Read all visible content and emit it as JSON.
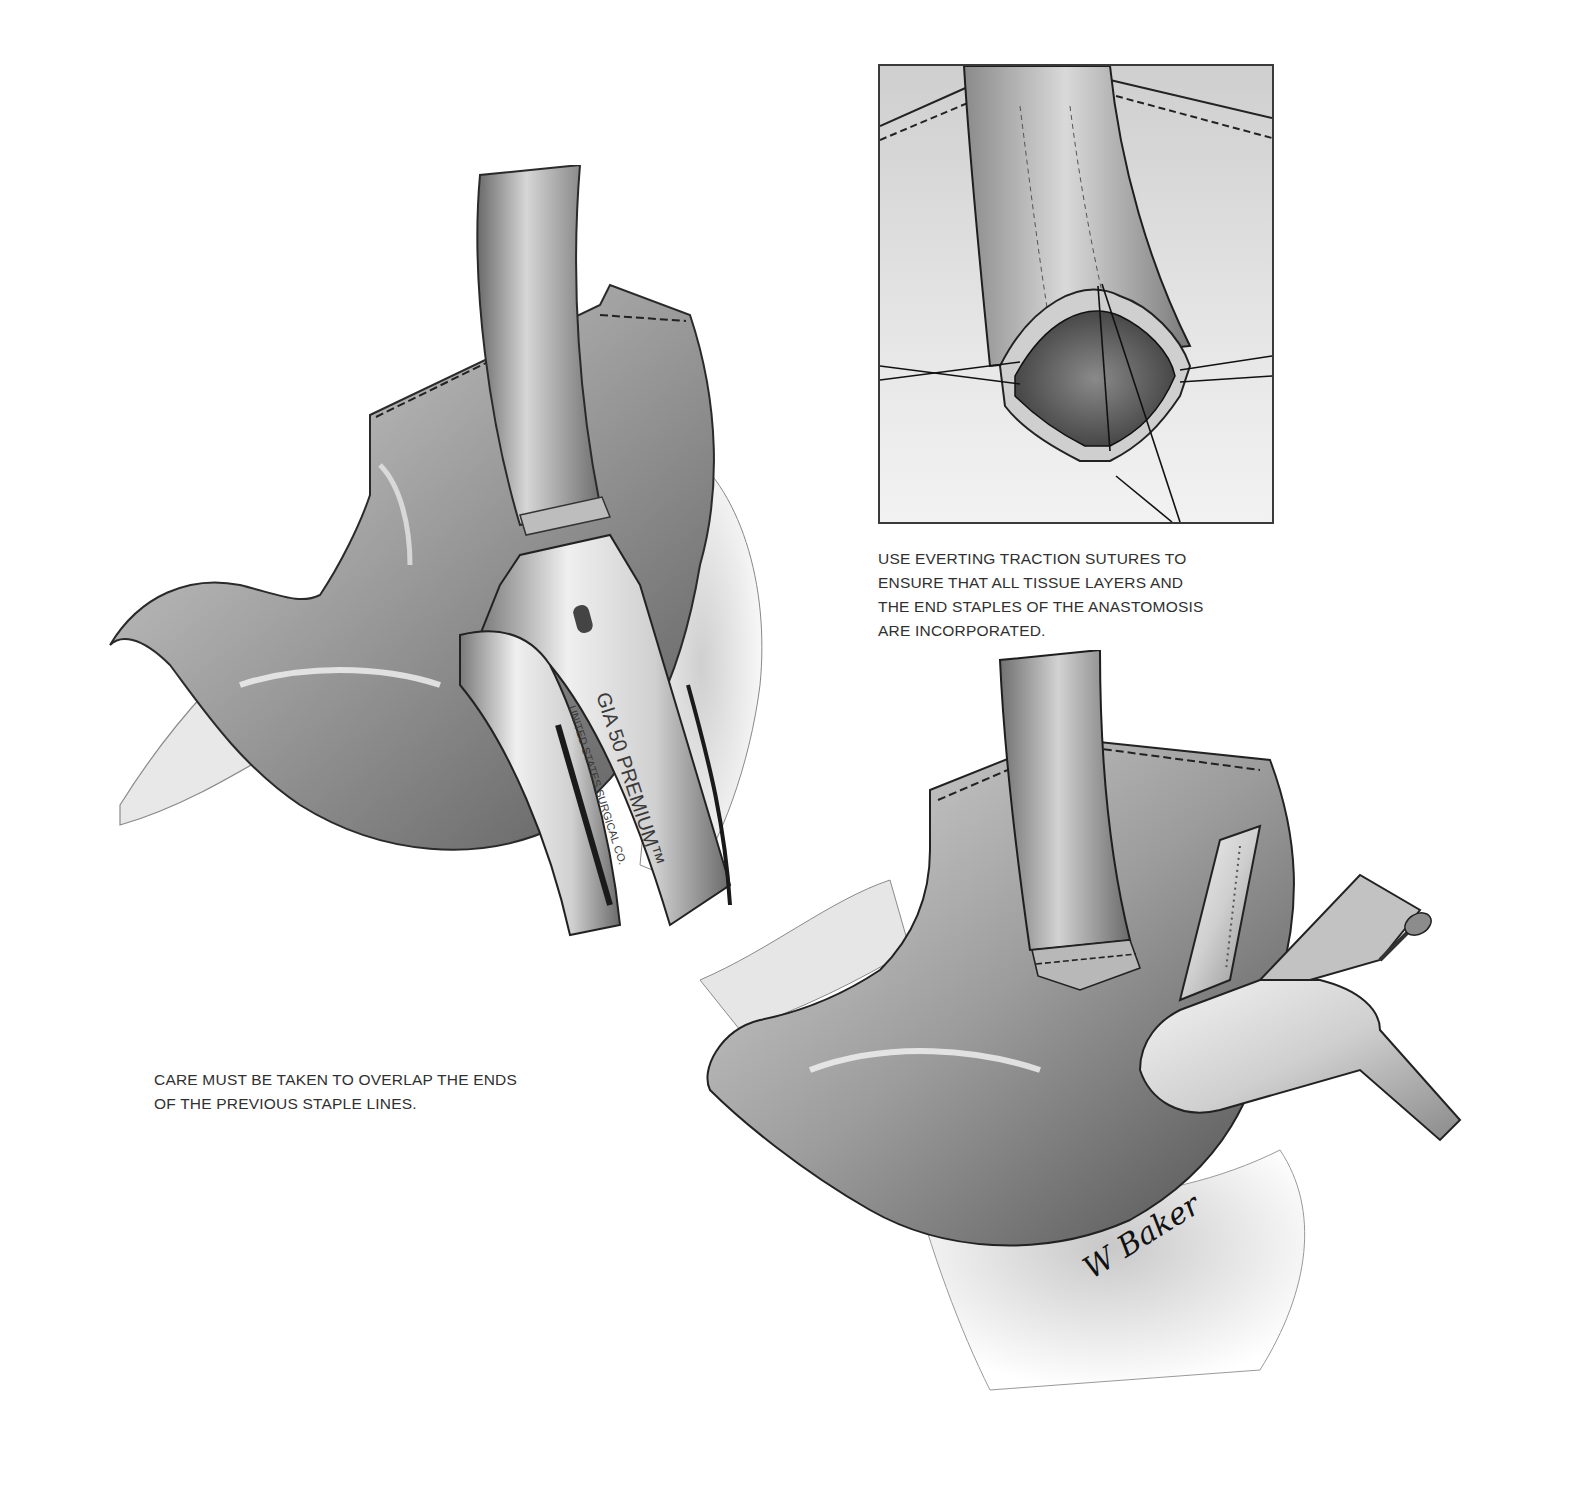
{
  "page": {
    "background": "#ffffff",
    "ink_color": "#303030"
  },
  "figures": {
    "left_illustration": {
      "label": "Stomach with GIA stapler applied across esophageal tube",
      "instrument": {
        "brand_text": "GIA 50 PREMIUM™",
        "maker_text": "UNITED STATES SURGICAL CO."
      },
      "caption": "CARE MUST BE TAKEN TO OVERLAP THE ENDS\nOF THE PREVIOUS STAPLE LINES."
    },
    "inset_illustration": {
      "label": "Close-up of anastomosis with everting traction sutures",
      "caption": "USE EVERTING TRACTION SUTURES TO\nENSURE THAT ALL TISSUE LAYERS AND\nTHE END STAPLES OF THE ANASTOMOSIS\nARE INCORPORATED."
    },
    "right_illustration": {
      "label": "Stomach with TA stapler closing the anastomosis",
      "signature": "W Baker"
    }
  }
}
